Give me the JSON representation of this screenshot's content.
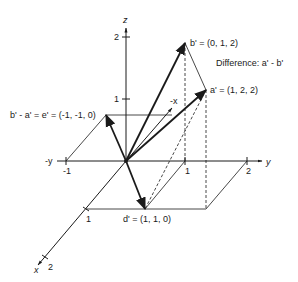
{
  "diagram": {
    "title": "Difference: a' - b'",
    "axes": {
      "z": {
        "label": "z",
        "ticks": [
          "1",
          "2"
        ]
      },
      "y": {
        "label": "y",
        "neg_label": "-y",
        "ticks": [
          "1",
          "2"
        ],
        "neg_ticks": [
          "-1"
        ]
      },
      "x": {
        "label": "x",
        "neg_label": "-x",
        "ticks": [
          "1",
          "2"
        ]
      }
    },
    "vectors": {
      "a": {
        "label": "a' = (1, 2, 2)"
      },
      "b": {
        "label": "b' = (0, 1, 2)"
      },
      "d": {
        "label": "d' = (1, 1, 0)"
      },
      "e": {
        "label": "b' - a' = e' = (-1, -1, 0)"
      }
    },
    "colors": {
      "ink": "#1a1a1a",
      "background": "#ffffff"
    }
  }
}
